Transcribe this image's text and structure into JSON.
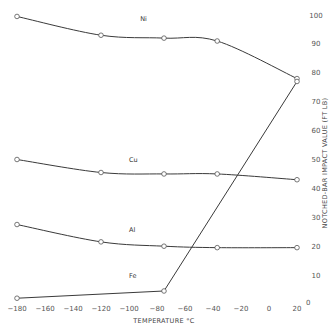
{
  "chart_data": {
    "type": "line",
    "title": "",
    "xlabel": "TEMPERATURE °C",
    "ylabel": "NOTCHED-BAR IMPACT VALUE (FT LB)",
    "xlim": [
      -180,
      20
    ],
    "ylim": [
      0,
      100
    ],
    "grid": false,
    "legend": "inline labels on curves",
    "x_ticks": [
      -180,
      -160,
      -140,
      -120,
      -100,
      -80,
      -60,
      -40,
      -20,
      0,
      20
    ],
    "y_ticks": [
      0,
      10,
      20,
      30,
      40,
      50,
      60,
      70,
      80,
      90,
      100
    ],
    "y_axis_position": "right",
    "series": [
      {
        "name": "Ni",
        "x": [
          -180,
          -120,
          -75,
          -37,
          20
        ],
        "values": [
          99.5,
          93,
          92,
          91,
          78
        ]
      },
      {
        "name": "Cu",
        "x": [
          -180,
          -120,
          -75,
          -37,
          20
        ],
        "values": [
          50,
          45.5,
          45,
          45,
          43
        ]
      },
      {
        "name": "Al",
        "x": [
          -180,
          -120,
          -75,
          -37,
          20
        ],
        "values": [
          27.5,
          21.5,
          20,
          19.5,
          19.5
        ]
      },
      {
        "name": "Fe",
        "x": [
          -180,
          -75,
          20
        ],
        "values": [
          2,
          4.5,
          77
        ]
      }
    ]
  },
  "labels": {
    "x_axis_title": "TEMPERATURE",
    "x_axis_unit": "°C",
    "y_axis_title": "NOTCHED-BAR IMPACT VALUE (FT LB)",
    "x_ticks": [
      "-180",
      "-160",
      "-140",
      "-120",
      "-100",
      "-80",
      "-60",
      "-40",
      "-20",
      "0",
      "20"
    ],
    "y_ticks": [
      "0",
      "10",
      "20",
      "30",
      "40",
      "50",
      "60",
      "70",
      "80",
      "90",
      "100"
    ],
    "series_labels": [
      "Ni",
      "Cu",
      "Al",
      "Fe"
    ]
  }
}
